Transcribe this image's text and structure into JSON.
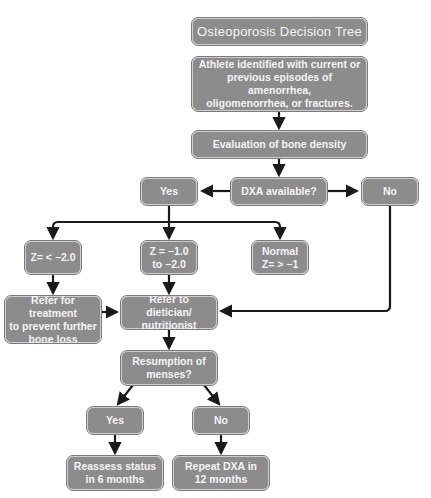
{
  "diagram": {
    "title": "Osteoporosis Decision Tree",
    "nodes": {
      "start": "Athlete identified with current or\nprevious episodes of amenorrhea,\noligomenorrhea, or fractures.",
      "evaluation": "Evaluation of bone density",
      "dxa": "DXA available?",
      "dxa_yes": "Yes",
      "dxa_no": "No",
      "z_low": "Z= < −2.0",
      "z_mid": "Z = −1.0\nto −2.0",
      "z_normal": "Normal\nZ= > −1",
      "refer_treatment": "Refer for treatment\nto prevent further\nbone loss",
      "refer_dietician": "Refer to dietician/\nnutritionist",
      "menses": "Resumption of\nmenses?",
      "menses_yes": "Yes",
      "menses_no": "No",
      "reassess": "Reassess status\nin 6 months",
      "repeat_dxa": "Repeat DXA in\n12 months"
    },
    "colors": {
      "box_fill": "#8c8c8c",
      "box_border": "#cfcfcf",
      "text": "#f4f4f4",
      "line": "#1a1a1a"
    }
  }
}
